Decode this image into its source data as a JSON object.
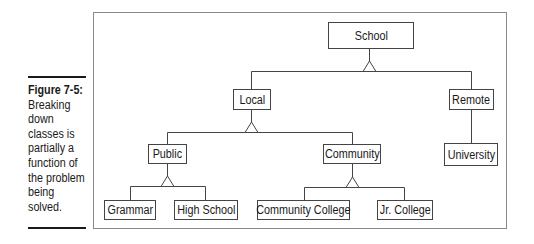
{
  "caption": {
    "title": "Figure 7-5:",
    "body": "Breaking down classes is partially a function of the problem being solved.",
    "lines": [
      "Breaking",
      "down",
      "classes is",
      "partially a",
      "function of",
      "the problem",
      "being",
      "solved."
    ]
  },
  "diagram": {
    "type": "class-hierarchy",
    "nodes": {
      "school": "School",
      "local": "Local",
      "remote": "Remote",
      "public": "Public",
      "community": "Community",
      "university": "University",
      "grammar": "Grammar",
      "high_school": "High School",
      "community_college": "Community College",
      "jr_college": "Jr. College"
    },
    "edges": [
      {
        "parent": "School",
        "children": [
          "Local",
          "Remote"
        ]
      },
      {
        "parent": "Local",
        "children": [
          "Public",
          "Community"
        ]
      },
      {
        "parent": "Remote",
        "children": [
          "University"
        ]
      },
      {
        "parent": "Public",
        "children": [
          "Grammar",
          "High School"
        ]
      },
      {
        "parent": "Community",
        "children": [
          "Community College",
          "Jr. College"
        ]
      }
    ],
    "line_color": "#444444",
    "frame_color": "#8a8a8a"
  }
}
